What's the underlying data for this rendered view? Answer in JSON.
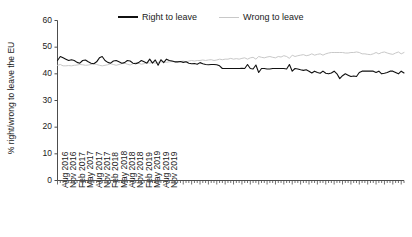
{
  "chart_data": {
    "type": "line",
    "title": "",
    "xlabel": "",
    "ylabel": "% right/wrong to leave the EU",
    "ylim": [
      0,
      60
    ],
    "yticks": [
      0,
      10,
      20,
      30,
      40,
      50,
      60
    ],
    "grid": false,
    "legend_position": "top-center",
    "x_tick_labels": [
      "Aug 2016",
      "Nov 2016",
      "Feb 2017",
      "May 2017",
      "Aug 2017",
      "Nov 2017",
      "Feb 2018",
      "May 2018",
      "Aug 2018",
      "Nov 2018",
      "Feb 2019",
      "May 2019",
      "Aug 2019",
      "Nov 2019"
    ],
    "x_tick_label_interval_months": 3,
    "x_start": "Aug 2016",
    "x_end": "Dec 2019",
    "n_points": 125,
    "series": [
      {
        "name": "Right to leave",
        "color": "#111111",
        "values": [
          45.0,
          46.5,
          46.0,
          45.5,
          45.0,
          45.3,
          45.0,
          44.3,
          44.0,
          45.0,
          45.2,
          44.5,
          44.0,
          43.8,
          44.5,
          46.0,
          46.5,
          45.0,
          44.3,
          44.0,
          44.8,
          45.0,
          44.5,
          44.0,
          44.2,
          45.0,
          44.8,
          44.0,
          43.8,
          44.2,
          45.0,
          44.5,
          44.0,
          45.5,
          44.0,
          45.2,
          43.2,
          45.3,
          44.2,
          45.5,
          45.0,
          44.8,
          44.5,
          44.5,
          44.6,
          44.3,
          44.5,
          44.0,
          43.8,
          43.9,
          43.6,
          44.2,
          43.8,
          43.5,
          43.4,
          43.5,
          43.5,
          43.4,
          43.0,
          42.0,
          42.0,
          42.0,
          42.0,
          42.0,
          42.0,
          42.0,
          42.1,
          42.0,
          43.5,
          42.0,
          41.8,
          43.3,
          40.5,
          42.0,
          42.0,
          41.8,
          41.8,
          42.0,
          42.0,
          42.0,
          42.0,
          42.0,
          41.8,
          43.5,
          41.0,
          42.0,
          41.8,
          41.5,
          41.3,
          41.5,
          41.0,
          40.3,
          41.0,
          40.5,
          40.2,
          41.0,
          40.2,
          40.0,
          40.3,
          41.0,
          40.0,
          38.2,
          39.3,
          40.0,
          39.5,
          39.0,
          39.2,
          39.0,
          40.5,
          41.0,
          41.0,
          41.0,
          41.0,
          41.0,
          40.5,
          41.0,
          40.0,
          40.2,
          40.5,
          41.0,
          41.0,
          40.5,
          40.0,
          41.0,
          40.3
        ]
      },
      {
        "name": "Wrong to leave",
        "color": "#c8c8c8",
        "values": [
          43.2,
          43.5,
          43.0,
          43.0,
          43.1,
          43.0,
          43.2,
          43.3,
          43.5,
          43.4,
          43.2,
          43.3,
          43.5,
          43.8,
          43.5,
          43.2,
          43.0,
          43.2,
          43.4,
          43.8,
          43.5,
          43.2,
          43.5,
          43.8,
          44.0,
          43.6,
          43.3,
          43.8,
          44.2,
          44.0,
          43.6,
          43.8,
          44.3,
          44.0,
          44.3,
          44.0,
          44.3,
          44.5,
          44.5,
          44.3,
          44.5,
          44.6,
          44.5,
          44.5,
          44.6,
          44.8,
          44.5,
          44.8,
          45.0,
          44.8,
          45.0,
          45.0,
          45.2,
          45.0,
          45.2,
          45.3,
          45.0,
          45.2,
          45.5,
          45.3,
          45.5,
          45.5,
          45.8,
          45.5,
          45.7,
          45.5,
          45.8,
          46.0,
          45.5,
          46.0,
          46.2,
          45.5,
          46.5,
          46.2,
          46.0,
          46.3,
          46.5,
          46.2,
          46.0,
          46.5,
          46.3,
          46.8,
          46.5,
          45.8,
          47.0,
          46.5,
          46.8,
          47.0,
          47.2,
          46.8,
          47.0,
          47.5,
          47.0,
          47.3,
          47.5,
          47.0,
          47.5,
          47.8,
          48.0,
          48.0,
          48.0,
          48.0,
          48.0,
          47.8,
          47.8,
          48.0,
          48.0,
          48.2,
          48.0,
          47.5,
          47.5,
          47.3,
          47.2,
          47.5,
          48.0,
          47.5,
          48.0,
          48.2,
          47.8,
          47.5,
          47.3,
          47.8,
          48.2,
          47.5,
          48.0
        ]
      }
    ]
  },
  "legend": {
    "entries": [
      {
        "label": "Right to leave"
      },
      {
        "label": "Wrong to leave"
      }
    ]
  },
  "axes": {
    "y_title": "% right/wrong to leave the EU"
  }
}
